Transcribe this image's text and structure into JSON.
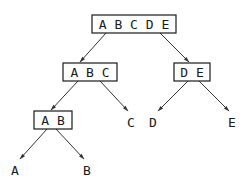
{
  "diagram": {
    "type": "binary-partition-tree",
    "nodes": [
      {
        "id": "abcde",
        "label": "A B C D E",
        "boxed": true
      },
      {
        "id": "abc",
        "label": "A B C",
        "boxed": true
      },
      {
        "id": "de",
        "label": "D E",
        "boxed": true
      },
      {
        "id": "ab",
        "label": "A B",
        "boxed": true
      },
      {
        "id": "c",
        "label": "C",
        "boxed": false
      },
      {
        "id": "d",
        "label": "D",
        "boxed": false
      },
      {
        "id": "e",
        "label": "E",
        "boxed": false
      },
      {
        "id": "a",
        "label": "A",
        "boxed": false
      },
      {
        "id": "b",
        "label": "B",
        "boxed": false
      }
    ],
    "edges": [
      {
        "from": "abcde",
        "to": "abc"
      },
      {
        "from": "abcde",
        "to": "de"
      },
      {
        "from": "abc",
        "to": "ab"
      },
      {
        "from": "abc",
        "to": "c"
      },
      {
        "from": "de",
        "to": "d"
      },
      {
        "from": "de",
        "to": "e"
      },
      {
        "from": "ab",
        "to": "a"
      },
      {
        "from": "ab",
        "to": "b"
      }
    ]
  }
}
